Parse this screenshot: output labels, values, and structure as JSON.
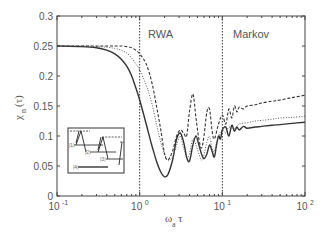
{
  "chart_data": {
    "type": "line",
    "title": "",
    "xlabel": "ω_a τ",
    "ylabel": "χ_n(τ)",
    "xscale": "log",
    "xlim": [
      0.1,
      100
    ],
    "ylim": [
      0,
      0.3
    ],
    "grid": false,
    "x_ticks": [
      "10^-1",
      "10^0",
      "10^1",
      "10^2"
    ],
    "y_ticks": [
      "0",
      "0.05",
      "0.1",
      "0.15",
      "0.2",
      "0.25",
      "0.3"
    ],
    "vertical_lines": [
      {
        "x": 1,
        "label": "RWA",
        "style": "dotted"
      },
      {
        "x": 10,
        "label": "Markov",
        "style": "dotted"
      }
    ],
    "series": [
      {
        "name": "solid",
        "style": "solid",
        "x": [
          0.1,
          0.2,
          0.3,
          0.4,
          0.5,
          0.6,
          0.7,
          0.8,
          0.9,
          1.0,
          1.2,
          1.4,
          1.6,
          1.8,
          2.0,
          2.2,
          2.5,
          2.8,
          3.1,
          3.4,
          3.7,
          4.0,
          4.4,
          4.8,
          5.2,
          5.6,
          6.0,
          6.5,
          7.0,
          7.5,
          8.0,
          8.5,
          9.0,
          9.5,
          10,
          11,
          12,
          13,
          14,
          15,
          16,
          18,
          20,
          25,
          30,
          40,
          50,
          70,
          100
        ],
        "y": [
          0.25,
          0.249,
          0.247,
          0.243,
          0.237,
          0.228,
          0.216,
          0.2,
          0.18,
          0.16,
          0.12,
          0.085,
          0.058,
          0.04,
          0.032,
          0.036,
          0.06,
          0.095,
          0.105,
          0.09,
          0.065,
          0.058,
          0.085,
          0.1,
          0.085,
          0.07,
          0.062,
          0.07,
          0.085,
          0.075,
          0.065,
          0.085,
          0.1,
          0.095,
          0.11,
          0.115,
          0.1,
          0.118,
          0.108,
          0.115,
          0.11,
          0.116,
          0.113,
          0.115,
          0.116,
          0.118,
          0.119,
          0.121,
          0.123
        ]
      },
      {
        "name": "dotted",
        "style": "dotted",
        "x": [
          0.1,
          0.2,
          0.3,
          0.4,
          0.5,
          0.6,
          0.7,
          0.8,
          0.9,
          1.0,
          1.2,
          1.4,
          1.6,
          1.8,
          2.0,
          2.2,
          2.5,
          2.8,
          3.1,
          3.4,
          3.7,
          4.0,
          4.4,
          4.8,
          5.2,
          5.6,
          6.0,
          6.5,
          7.0,
          7.5,
          8.0,
          9.0,
          10,
          11,
          12,
          14,
          16,
          20,
          25,
          30,
          40,
          50,
          70,
          100
        ],
        "y": [
          0.25,
          0.25,
          0.249,
          0.248,
          0.246,
          0.243,
          0.238,
          0.23,
          0.22,
          0.21,
          0.185,
          0.155,
          0.12,
          0.09,
          0.07,
          0.06,
          0.065,
          0.085,
          0.1,
          0.08,
          0.065,
          0.07,
          0.095,
          0.085,
          0.07,
          0.06,
          0.068,
          0.09,
          0.1,
          0.08,
          0.075,
          0.1,
          0.11,
          0.105,
          0.115,
          0.112,
          0.12,
          0.122,
          0.125,
          0.126,
          0.128,
          0.13,
          0.131,
          0.133
        ]
      },
      {
        "name": "dashed",
        "style": "dashed",
        "x": [
          0.1,
          0.2,
          0.3,
          0.4,
          0.5,
          0.6,
          0.7,
          0.8,
          0.9,
          1.0,
          1.2,
          1.4,
          1.6,
          1.8,
          2.0,
          2.2,
          2.5,
          2.8,
          3.1,
          3.4,
          3.7,
          4.0,
          4.4,
          4.8,
          5.2,
          5.6,
          6.0,
          6.5,
          7.0,
          7.5,
          8.0,
          9.0,
          10,
          11,
          12,
          13,
          14,
          15,
          16,
          18,
          20,
          25,
          30,
          40,
          50,
          70,
          100
        ],
        "y": [
          0.25,
          0.25,
          0.25,
          0.25,
          0.25,
          0.25,
          0.249,
          0.247,
          0.243,
          0.237,
          0.22,
          0.19,
          0.15,
          0.11,
          0.07,
          0.06,
          0.075,
          0.1,
          0.11,
          0.105,
          0.1,
          0.14,
          0.17,
          0.13,
          0.095,
          0.08,
          0.1,
          0.14,
          0.145,
          0.11,
          0.095,
          0.12,
          0.135,
          0.12,
          0.145,
          0.13,
          0.15,
          0.14,
          0.148,
          0.145,
          0.15,
          0.152,
          0.155,
          0.158,
          0.16,
          0.164,
          0.168
        ]
      }
    ],
    "inset": {
      "description": "energy level diagram with transitions",
      "labels": [
        "|1>",
        "|2>",
        "|3>",
        "|4>"
      ]
    }
  },
  "labels": {
    "rwa": "RWA",
    "markov": "Markov",
    "ylabel_main": "χ",
    "ylabel_sub": "n",
    "ylabel_arg": "(τ)",
    "xlabel_main": "ω",
    "xlabel_sub": "a",
    "xlabel_arg": "τ"
  }
}
